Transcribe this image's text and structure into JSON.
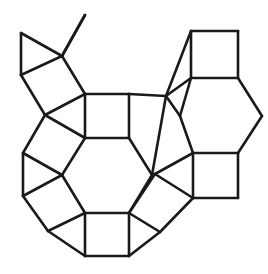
{
  "figure": {
    "title": "Polyhedron net line drawing",
    "canvas": {
      "width": 268,
      "height": 274
    },
    "style": {
      "background_color": "#ffffff",
      "stroke_color": "#1a1a1a",
      "fill_color": "#ffffff",
      "stroke_width": 2.6
    },
    "vertices": {
      "tri_top": [
        21,
        33
      ],
      "tri_bottom": [
        21,
        75
      ],
      "hub_upper_left": [
        62,
        56
      ],
      "stray_tip": [
        85,
        15
      ],
      "left_sq_low": [
        45,
        115
      ],
      "c_sq_tl": [
        85,
        94
      ],
      "c_sq_tr": [
        129,
        94
      ],
      "c_sq_br": [
        129,
        138
      ],
      "c_sq_bl": [
        85,
        138
      ],
      "hex_left": [
        62,
        175
      ],
      "hex_right": [
        152,
        175
      ],
      "c_hex_bl": [
        85,
        213
      ],
      "c_hex_br": [
        129,
        213
      ],
      "left_mid": [
        23,
        153
      ],
      "left_low": [
        23,
        196
      ],
      "bot_left": [
        48,
        231
      ],
      "bot_sq_bl": [
        85,
        256
      ],
      "bot_sq_br": [
        129,
        256
      ],
      "bot_right": [
        160,
        232
      ],
      "r_sq_tl": [
        191,
        31
      ],
      "r_sq_tr": [
        238,
        31
      ],
      "r_sq_br": [
        238,
        78
      ],
      "r_sq_bl": [
        191,
        78
      ],
      "r_hex_left": [
        180,
        116
      ],
      "r_hex_right": [
        262,
        116
      ],
      "r_hex_bl": [
        193,
        153
      ],
      "r_hex_br": [
        238,
        153
      ],
      "br_sq_br": [
        238,
        198
      ],
      "br_sq_bl": [
        193,
        198
      ],
      "mid_right_up": [
        166,
        96
      ],
      "mid_right_lo": [
        155,
        174
      ]
    },
    "edges": [
      [
        21,
        33,
        21,
        75
      ],
      [
        21,
        33,
        62,
        56
      ],
      [
        21,
        75,
        62,
        56
      ],
      [
        62,
        56,
        85,
        15
      ],
      [
        21,
        75,
        45,
        115
      ],
      [
        62,
        56,
        85,
        94
      ],
      [
        45,
        115,
        85,
        94
      ],
      [
        45,
        115,
        85,
        138
      ],
      [
        85,
        94,
        129,
        94
      ],
      [
        129,
        94,
        129,
        138
      ],
      [
        129,
        138,
        85,
        138
      ],
      [
        85,
        138,
        85,
        94
      ],
      [
        85,
        138,
        62,
        175
      ],
      [
        129,
        138,
        152,
        175
      ],
      [
        62,
        175,
        85,
        213
      ],
      [
        152,
        175,
        129,
        213
      ],
      [
        85,
        213,
        129,
        213
      ],
      [
        45,
        115,
        23,
        153
      ],
      [
        23,
        153,
        62,
        175
      ],
      [
        23,
        153,
        23,
        196
      ],
      [
        23,
        196,
        62,
        175
      ],
      [
        23,
        196,
        48,
        231
      ],
      [
        48,
        231,
        85,
        213
      ],
      [
        48,
        231,
        85,
        256
      ],
      [
        85,
        213,
        85,
        256
      ],
      [
        85,
        256,
        129,
        256
      ],
      [
        129,
        256,
        129,
        213
      ],
      [
        129,
        256,
        160,
        232
      ],
      [
        160,
        232,
        129,
        213
      ],
      [
        160,
        232,
        193,
        198
      ],
      [
        129,
        213,
        155,
        174
      ],
      [
        155,
        174,
        152,
        175
      ],
      [
        155,
        174,
        193,
        198
      ],
      [
        155,
        174,
        193,
        153
      ],
      [
        193,
        198,
        193,
        153
      ],
      [
        193,
        153,
        238,
        153
      ],
      [
        238,
        153,
        238,
        198
      ],
      [
        238,
        198,
        193,
        198
      ],
      [
        152,
        175,
        166,
        96
      ],
      [
        129,
        94,
        166,
        96
      ],
      [
        166,
        96,
        191,
        78
      ],
      [
        166,
        96,
        180,
        116
      ],
      [
        180,
        116,
        193,
        153
      ],
      [
        180,
        116,
        191,
        78
      ],
      [
        191,
        78,
        238,
        78
      ],
      [
        238,
        78,
        262,
        116
      ],
      [
        262,
        116,
        238,
        153
      ],
      [
        191,
        31,
        238,
        31
      ],
      [
        238,
        31,
        238,
        78
      ],
      [
        191,
        31,
        191,
        78
      ],
      [
        191,
        31,
        166,
        96
      ]
    ],
    "faces": [
      {
        "name": "triangle-upper-left",
        "points": "21,33 21,75 62,56"
      },
      {
        "name": "square-left-upper",
        "points": "21,75 62,56 85,94 45,115"
      },
      {
        "name": "square-center",
        "points": "85,94 129,94 129,138 85,138"
      },
      {
        "name": "hexagon-center",
        "points": "85,138 129,138 152,175 129,213 85,213 62,175"
      },
      {
        "name": "square-left-middle",
        "points": "45,115 85,138 62,175 23,153"
      },
      {
        "name": "triangle-left",
        "points": "23,153 62,175 23,196"
      },
      {
        "name": "square-left-lower",
        "points": "23,196 62,175 85,213 48,231"
      },
      {
        "name": "square-bottom",
        "points": "85,213 129,213 129,256 85,256"
      },
      {
        "name": "triangle-bottom-left",
        "points": "48,231 85,213 85,256"
      },
      {
        "name": "triangle-bottom-right",
        "points": "129,213 160,232 129,256"
      },
      {
        "name": "square-lower-right-rotated",
        "points": "129,213 155,174 193,198 160,232"
      },
      {
        "name": "square-right-lower",
        "points": "193,153 238,153 238,198 193,198"
      },
      {
        "name": "square-mid-right-rotated",
        "points": "129,138 152,175 155,174 166,96"
      },
      {
        "name": "square-upper-right",
        "points": "191,31 238,31 238,78 191,78"
      },
      {
        "name": "hexagon-right",
        "points": "191,78 238,78 262,116 238,153 193,153 180,116"
      },
      {
        "name": "square-upper-right-link",
        "points": "191,31 191,78 166,96"
      },
      {
        "name": "triangle-right-link",
        "points": "166,96 191,78 180,116"
      }
    ],
    "free_edge": {
      "name": "dangling-edge",
      "from": [
        62,
        56
      ],
      "to": [
        85,
        15
      ]
    },
    "counts": {
      "squares": 9,
      "hexagons": 2,
      "triangles": 5,
      "total_edges": 51
    }
  }
}
